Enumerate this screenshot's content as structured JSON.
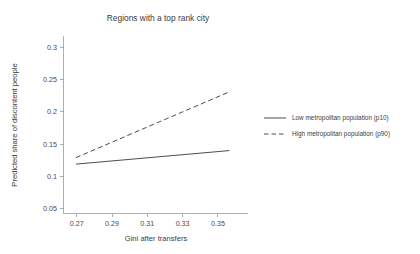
{
  "chart_data": {
    "type": "line",
    "title": "Regions with a top rank city",
    "xlabel": "Gini after transfers",
    "ylabel": "Predicted share of discontent people",
    "xlim": [
      0.2625,
      0.3625
    ],
    "ylim": [
      0.0425,
      0.3175
    ],
    "xticks": [
      0.27,
      0.29,
      0.31,
      0.33,
      0.35
    ],
    "xticklabels": [
      "0.27",
      "0.29",
      "0.31",
      "0.33",
      "0.35"
    ],
    "yticks": [
      0.05,
      0.1,
      0.15,
      0.2,
      0.25,
      0.3
    ],
    "yticklabels": [
      "0.05",
      "0.1",
      "0.15",
      "0.2",
      "0.25",
      "0.3"
    ],
    "grid": false,
    "legend_position": "right",
    "series": [
      {
        "name": "Low metropolitan population (p10)",
        "style": "solid",
        "color": "#4d4d4d",
        "x": [
          0.2695,
          0.3565
        ],
        "values": [
          0.119,
          0.14
        ]
      },
      {
        "name": "High metropolitan population (p90)",
        "style": "dashed",
        "color": "#4d4d4d",
        "x": [
          0.2695,
          0.3565
        ],
        "values": [
          0.129,
          0.231
        ]
      }
    ]
  },
  "legend": {
    "entries": [
      {
        "label": "Low metropolitan population (p10)",
        "style": "solid"
      },
      {
        "label": "High metropolitan population (p90)",
        "style": "dashed"
      }
    ]
  }
}
